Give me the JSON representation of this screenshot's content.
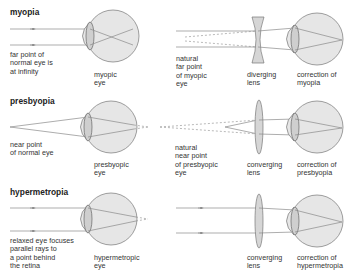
{
  "colors": {
    "eye_fill": "#e6e6e6",
    "lens_fill": "#cfcfcf",
    "stroke": "#777777",
    "ray": "#8a8a8a",
    "text": "#333333"
  },
  "rows": [
    {
      "id": "myopia",
      "title": "myopia",
      "left_caption": "far point of\nnormal eye is\nat infinity",
      "eye_caption": "myopic\neye",
      "virtual_caption": "natural\nfar point\nof myopic\neye",
      "lens_type": "diverging",
      "lens_caption": "diverging\nlens",
      "correction_caption": "correction of\nmyopia"
    },
    {
      "id": "presbyopia",
      "title": "presbyopia",
      "left_caption": "near point\nof normal eye",
      "eye_caption": "presbyopic\neye",
      "virtual_caption": "natural\nnear point\nof presbyopic\neye",
      "lens_type": "converging",
      "lens_caption": "converging\nlens",
      "correction_caption": "correction of\npresbyopia"
    },
    {
      "id": "hypermetropia",
      "title": "hypermetropia",
      "left_caption": "relaxed eye focuses\nparallel rays to\na point behind\nthe retina",
      "eye_caption": "hypermetropic\neye",
      "virtual_caption": "",
      "lens_type": "converging",
      "lens_caption": "converging\nlens",
      "correction_caption": "correction of\nhypermetropia"
    }
  ]
}
